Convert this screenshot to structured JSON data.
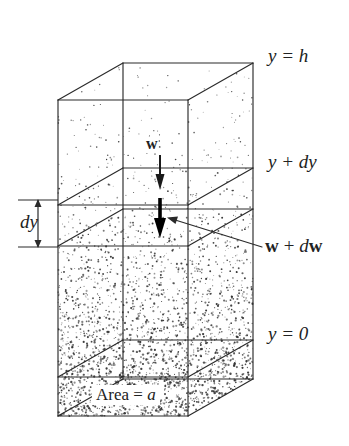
{
  "figure": {
    "background_color": "#ffffff",
    "ink_color": "#222222"
  },
  "labels": {
    "top_level": "y = h",
    "slab_top": "y + dy",
    "slab_force": "w + dw",
    "base_level": "y = 0",
    "thickness": "dy",
    "force": "w",
    "area_prefix": "Area = ",
    "area_symbol": "a"
  },
  "icons": {
    "weight_arrow": "down-arrow-icon",
    "weight_plus_arrow": "thick-down-arrow-icon",
    "dimension_arrow": "double-headed-vertical-arrow-icon",
    "leader": "leader-line-icon"
  },
  "geometry": {
    "front_left_x": 58,
    "front_right_x": 188,
    "back_left_x": 123,
    "back_right_x": 253,
    "depth_dx": 65,
    "depth_dy": -37,
    "top_back_y": 63,
    "top_front_y": 100,
    "slab_top_back_y": 168,
    "slab_top_front_y": 205,
    "slab_bottom_back_y": 209,
    "slab_bottom_front_y": 246,
    "base_back_y": 340,
    "base_front_y": 377,
    "bottom_back_y": 379,
    "bottom_front_y": 416
  },
  "stipple": {
    "description": "Random dot stipple whose density increases with depth, representing compressible fluid.",
    "top_density": "sparse",
    "bottom_density": "dense"
  },
  "chart_data": {
    "type": "diagram",
    "elements": [
      {
        "name": "top_surface",
        "label": "y = h",
        "kind": "horizontal-plane"
      },
      {
        "name": "slab_top",
        "label": "y + dy",
        "kind": "horizontal-plane"
      },
      {
        "name": "slab_bottom",
        "label": "",
        "kind": "horizontal-plane"
      },
      {
        "name": "base_plane",
        "label": "y = 0",
        "kind": "horizontal-plane"
      },
      {
        "name": "weight_top",
        "label": "w",
        "kind": "downward-vector"
      },
      {
        "name": "weight_bottom",
        "label": "w + dw",
        "kind": "downward-vector"
      },
      {
        "name": "thickness_dim",
        "label": "dy",
        "kind": "dimension"
      },
      {
        "name": "cross_section",
        "label": "Area = a",
        "kind": "annotation"
      }
    ]
  }
}
